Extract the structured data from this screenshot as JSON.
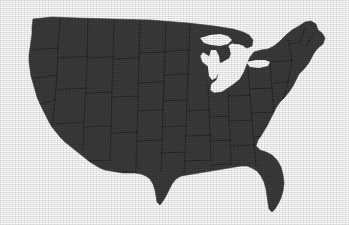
{
  "figure": {
    "kind": "choropleth-silhouette-map",
    "title": "",
    "caption": "",
    "has_text_labels": false,
    "has_legend": false,
    "has_border": false,
    "canvas": {
      "width": 349,
      "height": 225
    }
  },
  "colors": {
    "background": "#fefefe",
    "land_fill": "#3b3b3b",
    "state_border": "#1c1c1c",
    "coastline": "#3b3b3b",
    "water": "#fefefe"
  },
  "map": {
    "projection_hint": "albers-usa",
    "extent_px": {
      "left": 28,
      "top": 15,
      "right": 327,
      "bottom": 212
    },
    "landmass_outline": "M 33 19 L 52 17 L 78 18 L 112 19 L 150 20 L 188 23 L 214 26 L 233 29 L 243 32 L 249 35 L 253 40 L 252 46 L 247 48 L 240 45 L 232 43 L 228 46 L 231 52 L 229 58 L 222 62 L 216 63 L 212 60 L 208 55 L 203 52 L 200 56 L 202 62 L 207 66 L 214 69 L 218 74 L 216 80 L 211 84 L 210 90 L 214 93 L 222 92 L 228 88 L 234 84 L 240 79 L 244 72 L 247 64 L 250 57 L 254 52 L 261 50 L 268 49 L 274 46 L 280 41 L 286 35 L 292 30 L 299 26 L 305 22 L 311 21 L 316 24 L 318 30 L 322 33 L 325 38 L 323 44 L 318 48 L 314 53 L 311 59 L 308 64 L 304 69 L 299 74 L 296 80 L 293 86 L 289 92 L 285 97 L 280 102 L 276 108 L 273 114 L 270 120 L 267 126 L 264 131 L 261 136 L 258 140 L 256 146 L 260 150 L 266 152 L 272 155 L 277 160 L 281 167 L 283 175 L 284 183 L 283 191 L 281 198 L 278 204 L 275 209 L 272 212 L 269 209 L 268 203 L 267 196 L 266 189 L 264 182 L 261 176 L 257 171 L 252 168 L 247 166 L 241 166 L 235 167 L 229 168 L 223 169 L 217 170 L 211 171 L 205 172 L 199 173 L 193 174 L 187 175 L 181 176 L 176 179 L 172 184 L 169 190 L 166 196 L 163 201 L 160 205 L 157 202 L 156 196 L 155 190 L 153 184 L 150 179 L 146 176 L 141 174 L 135 173 L 129 173 L 123 173 L 117 172 L 111 171 L 105 170 L 100 168 L 95 165 L 90 162 L 85 158 L 80 154 L 75 150 L 70 146 L 65 142 L 60 137 L 56 132 L 52 127 L 49 122 L 46 116 L 43 110 L 40 104 L 37 97 L 35 90 L 33 83 L 31 76 L 30 69 L 29 62 L 29 55 L 30 48 L 31 41 L 32 34 L 32 27 Z",
    "great_lakes": [
      {
        "name": "lake-superior",
        "outline": "M 200 38 L 210 35 L 220 34 L 228 36 L 232 40 L 228 44 L 220 46 L 211 45 L 204 43 Z"
      },
      {
        "name": "lake-michigan",
        "outline": "M 211 50 L 216 50 L 219 56 L 220 64 L 219 72 L 216 78 L 212 80 L 209 76 L 208 68 L 208 60 Z"
      },
      {
        "name": "lake-huron",
        "outline": "M 231 46 L 238 44 L 244 46 L 246 52 L 243 58 L 237 60 L 232 57 L 230 51 Z"
      },
      {
        "name": "lake-erie-ontario",
        "outline": "M 246 62 L 256 60 L 265 60 L 270 62 L 268 66 L 259 68 L 250 67 Z"
      }
    ],
    "notable_features": [
      {
        "name": "florida-peninsula",
        "tip_px": [
          272,
          212
        ]
      },
      {
        "name": "texas-southern-tip",
        "tip_px": [
          160,
          205
        ]
      },
      {
        "name": "maine-northeast",
        "tip_px": [
          318,
          22
        ]
      },
      {
        "name": "cape-cod",
        "tip_px": [
          322,
          57
        ]
      },
      {
        "name": "michigan-lower-peninsula",
        "tip_px": [
          221,
          80
        ]
      },
      {
        "name": "pacific-northwest-corner",
        "tip_px": [
          33,
          19
        ]
      },
      {
        "name": "southern-california-coast",
        "tip_px": [
          60,
          137
        ]
      }
    ],
    "state_borders": [
      "M 60 19 L 58 48",
      "M 58 48 L 33 50",
      "M 58 48 L 57 75",
      "M 57 75 L 34 78",
      "M 57 75 L 55 100",
      "M 55 100 L 41 104",
      "M 55 100 L 52 127",
      "M 88 19 L 87 56",
      "M 87 56 L 58 58",
      "M 87 56 L 86 88",
      "M 86 88 L 57 90",
      "M 86 88 L 84 122",
      "M 84 122 L 56 124",
      "M 84 122 L 83 150",
      "M 114 20 L 113 57",
      "M 113 57 L 87 58",
      "M 113 57 L 112 92",
      "M 112 92 L 86 93",
      "M 112 92 L 111 126",
      "M 111 126 L 84 127",
      "M 111 126 L 110 160",
      "M 110 160 L 83 161",
      "M 140 21 L 139 58",
      "M 139 58 L 114 59",
      "M 139 58 L 138 96",
      "M 138 96 L 112 97",
      "M 138 96 L 137 132",
      "M 137 132 L 111 133",
      "M 137 132 L 136 172",
      "M 136 172 L 110 172",
      "M 166 23 L 165 52",
      "M 165 52 L 140 53",
      "M 165 52 L 164 82",
      "M 164 82 L 138 83",
      "M 164 82 L 163 110",
      "M 163 110 L 137 111",
      "M 163 110 L 162 140",
      "M 162 140 L 136 141",
      "M 162 140 L 161 172",
      "M 190 24 L 189 50",
      "M 189 50 L 166 51",
      "M 189 50 L 188 74",
      "M 188 74 L 164 75",
      "M 188 74 L 187 100",
      "M 187 100 L 163 101",
      "M 187 100 L 186 126",
      "M 186 126 L 162 127",
      "M 186 126 L 185 152",
      "M 185 152 L 161 153",
      "M 185 152 L 184 174",
      "M 208 85 L 209 110",
      "M 209 110 L 187 111",
      "M 209 110 L 210 135",
      "M 210 135 L 186 136",
      "M 210 135 L 211 160",
      "M 211 160 L 185 161",
      "M 228 92 L 229 116",
      "M 229 116 L 209 117",
      "M 229 116 L 230 140",
      "M 230 140 L 210 141",
      "M 230 140 L 231 164",
      "M 231 164 L 211 165",
      "M 248 70 L 250 95",
      "M 250 95 L 229 96",
      "M 250 95 L 252 120",
      "M 252 120 L 230 121",
      "M 252 120 L 254 145",
      "M 254 145 L 231 146",
      "M 254 145 L 256 166",
      "M 270 64 L 272 88",
      "M 272 88 L 250 89",
      "M 272 88 L 274 112",
      "M 274 112 L 252 113",
      "M 274 112 L 270 136",
      "M 270 136 L 254 137",
      "M 288 40 L 292 60",
      "M 292 60 L 272 62",
      "M 292 60 L 288 82",
      "M 288 82 L 273 83",
      "M 288 82 L 283 100",
      "M 305 28 L 300 42",
      "M 300 42 L 290 44",
      "M 313 34 L 306 46"
    ]
  }
}
